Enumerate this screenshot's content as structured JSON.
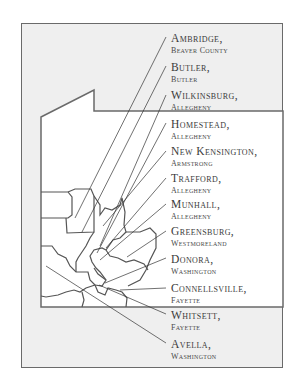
{
  "map": {
    "colors": {
      "frame_fill": "#efefef",
      "frame_border": "#6a6a6a",
      "region_fill": "#ffffff",
      "region_border": "#555555",
      "leader_lines": "#333333",
      "text": "#3a3a3a"
    },
    "labels": [
      {
        "city": "Ambridge,",
        "county": "Beaver County",
        "y": 33
      },
      {
        "city": "Butler,",
        "county": "Butler",
        "y": 62
      },
      {
        "city": "Wilkinsburg,",
        "county": "Allegheny",
        "y": 90
      },
      {
        "city": "Homestead,",
        "county": "Allegheny",
        "y": 119
      },
      {
        "city": "New Kensington,",
        "county": "Armstrong",
        "y": 146
      },
      {
        "city": "Trafford,",
        "county": "Allegheny",
        "y": 173
      },
      {
        "city": "Munhall,",
        "county": "Allegheny",
        "y": 199
      },
      {
        "city": "Greensburg,",
        "county": "Westmoreland",
        "y": 226
      },
      {
        "city": "Donora,",
        "county": "Washington",
        "y": 254
      },
      {
        "city": "Connellsville,",
        "county": "Fayette",
        "y": 283
      },
      {
        "city": "Whitsett,",
        "county": "Fayette",
        "y": 310
      },
      {
        "city": "Avella,",
        "county": "Washington",
        "y": 339
      }
    ]
  }
}
